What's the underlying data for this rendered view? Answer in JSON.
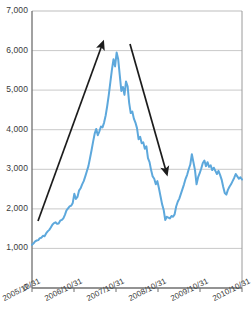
{
  "chart_data": {
    "type": "line",
    "title": "",
    "subtitle": "",
    "xlabel": "",
    "ylabel": "",
    "ylim": [
      0,
      7000
    ],
    "ytick_labels": [
      "7,000",
      "6,000",
      "5,000",
      "4,000",
      "3,000",
      "2,000",
      "1,000",
      "0"
    ],
    "ytick_values": [
      7000,
      6000,
      5000,
      4000,
      3000,
      2000,
      1000,
      0
    ],
    "xtick_labels": [
      "2005/10/31",
      "2006/10/31",
      "2007/10/31",
      "2008/10/31",
      "2009/10/31",
      "2010/10/31"
    ],
    "grid": "horizontal",
    "legend": "none",
    "series": [
      {
        "name": "index",
        "color": "#5DA8DC",
        "values": [
          1090,
          1130,
          1180,
          1200,
          1210,
          1260,
          1270,
          1320,
          1310,
          1380,
          1430,
          1470,
          1530,
          1600,
          1640,
          1660,
          1620,
          1630,
          1700,
          1720,
          1760,
          1850,
          1960,
          2010,
          2060,
          2080,
          2150,
          2380,
          2250,
          2300,
          2460,
          2520,
          2620,
          2700,
          2820,
          2950,
          3080,
          3280,
          3480,
          3700,
          3900,
          4020,
          3860,
          3960,
          4080,
          4060,
          4180,
          4360,
          4600,
          4880,
          5200,
          5520,
          5780,
          5600,
          5950,
          5780,
          5380,
          4980,
          5080,
          4880,
          5220,
          5100,
          4680,
          4420,
          4460,
          4280,
          4180,
          4040,
          3760,
          3820,
          3660,
          3680,
          3520,
          3580,
          3280,
          3180,
          2980,
          2820,
          2760,
          2620,
          2700,
          2520,
          2320,
          2120,
          1980,
          1720,
          1800,
          1780,
          1760,
          1820,
          1800,
          1860,
          2060,
          2180,
          2260,
          2380,
          2500,
          2620,
          2760,
          2860,
          3000,
          3120,
          3380,
          3180,
          2980,
          2620,
          2800,
          2900,
          3020,
          3160,
          3220,
          3080,
          3180,
          3060,
          3100,
          2980,
          3040,
          2960,
          2880,
          2960,
          2860,
          2740,
          2560,
          2400,
          2360,
          2480,
          2560,
          2620,
          2700,
          2780,
          2880,
          2820,
          2760,
          2800,
          2740
        ]
      }
    ],
    "annotations": [
      {
        "name": "uptrend-arrow",
        "direction": "up",
        "x1": 38,
        "y1": 221,
        "x2": 102,
        "y2": 45
      },
      {
        "name": "downtrend-arrow",
        "direction": "down",
        "x1": 130,
        "y1": 44,
        "x2": 166,
        "y2": 171
      }
    ],
    "colors": {
      "series": "#5DA8DC",
      "grid": "#c9c9c9",
      "axis": "#8a8a8a",
      "text": "#3a3a3a",
      "annotation": "#1c1c1c"
    }
  }
}
